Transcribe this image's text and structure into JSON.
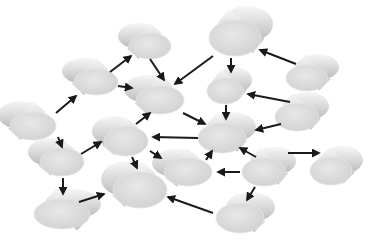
{
  "diagram": {
    "type": "network-graph",
    "background": "#ffffff",
    "node_style": {
      "shape": "3d-cylinder-disk",
      "face_color": "#d9d9d9",
      "side_light": "#f4f4f4",
      "side_dark": "#bdbdbd",
      "face_highlight": "#e6e6e6"
    },
    "edge_style": {
      "color": "#1a1a1a",
      "width": 2,
      "arrowhead": "filled-triangle"
    },
    "nodes": [
      {
        "id": "N1",
        "cx": 150,
        "cy": 46,
        "rx": 21,
        "ry": 13,
        "dx": -11,
        "dy": -10
      },
      {
        "id": "N2",
        "cx": 235,
        "cy": 38,
        "rx": 26,
        "ry": 18,
        "dx": 12,
        "dy": -14
      },
      {
        "id": "N3",
        "cx": 96,
        "cy": 82,
        "rx": 22,
        "ry": 13,
        "dx": -12,
        "dy": -11
      },
      {
        "id": "N4",
        "cx": 160,
        "cy": 100,
        "rx": 24,
        "ry": 14,
        "dx": -12,
        "dy": -11
      },
      {
        "id": "N5",
        "cx": 225,
        "cy": 91,
        "rx": 18,
        "ry": 13,
        "dx": 9,
        "dy": -11
      },
      {
        "id": "N6",
        "cx": 307,
        "cy": 78,
        "rx": 21,
        "ry": 13,
        "dx": 11,
        "dy": -11
      },
      {
        "id": "N7",
        "cx": 33,
        "cy": 126,
        "rx": 23,
        "ry": 14,
        "dx": -12,
        "dy": -11
      },
      {
        "id": "N8",
        "cx": 297,
        "cy": 117,
        "rx": 22,
        "ry": 14,
        "dx": 10,
        "dy": -11
      },
      {
        "id": "N9",
        "cx": 126,
        "cy": 141,
        "rx": 22,
        "ry": 15,
        "dx": -12,
        "dy": -10
      },
      {
        "id": "N10",
        "cx": 222,
        "cy": 138,
        "rx": 24,
        "ry": 15,
        "dx": 10,
        "dy": -11
      },
      {
        "id": "N11",
        "cx": 62,
        "cy": 162,
        "rx": 22,
        "ry": 14,
        "dx": -12,
        "dy": -10
      },
      {
        "id": "N12",
        "cx": 188,
        "cy": 172,
        "rx": 24,
        "ry": 14,
        "dx": -12,
        "dy": -9
      },
      {
        "id": "N13",
        "cx": 264,
        "cy": 172,
        "rx": 22,
        "ry": 14,
        "dx": 10,
        "dy": -11
      },
      {
        "id": "N14",
        "cx": 331,
        "cy": 171,
        "rx": 21,
        "ry": 14,
        "dx": 11,
        "dy": -11
      },
      {
        "id": "N15",
        "cx": 140,
        "cy": 190,
        "rx": 27,
        "ry": 18,
        "dx": -12,
        "dy": -11
      },
      {
        "id": "N16",
        "cx": 62,
        "cy": 214,
        "rx": 28,
        "ry": 15,
        "dx": 11,
        "dy": -10
      },
      {
        "id": "N17",
        "cx": 240,
        "cy": 218,
        "rx": 24,
        "ry": 15,
        "dx": 11,
        "dy": -11
      }
    ],
    "edges": [
      {
        "from": "N3",
        "to": "N1",
        "x1": 110,
        "y1": 72,
        "x2": 131,
        "y2": 56
      },
      {
        "from": "N1",
        "to": "N4",
        "x1": 150,
        "y1": 59,
        "x2": 164,
        "y2": 80
      },
      {
        "from": "N3",
        "to": "N4",
        "x1": 118,
        "y1": 86,
        "x2": 132,
        "y2": 88
      },
      {
        "from": "N2",
        "to": "N4",
        "x1": 213,
        "y1": 56,
        "x2": 175,
        "y2": 84
      },
      {
        "from": "N2",
        "to": "N5",
        "x1": 231,
        "y1": 58,
        "x2": 231,
        "y2": 72
      },
      {
        "from": "N6",
        "to": "N2",
        "x1": 296,
        "y1": 64,
        "x2": 260,
        "y2": 50
      },
      {
        "from": "N5",
        "to": "N10",
        "x1": 226,
        "y1": 105,
        "x2": 226,
        "y2": 119
      },
      {
        "from": "N8",
        "to": "N5",
        "x1": 290,
        "y1": 102,
        "x2": 248,
        "y2": 94
      },
      {
        "from": "N4",
        "to": "N10",
        "x1": 183,
        "y1": 113,
        "x2": 205,
        "y2": 124
      },
      {
        "from": "N10",
        "to": "N9",
        "x1": 198,
        "y1": 138,
        "x2": 153,
        "y2": 137
      },
      {
        "from": "N8",
        "to": "N10",
        "x1": 281,
        "y1": 124,
        "x2": 256,
        "y2": 130
      },
      {
        "from": "N7",
        "to": "N3",
        "x1": 56,
        "y1": 113,
        "x2": 76,
        "y2": 96
      },
      {
        "from": "N7",
        "to": "N11",
        "x1": 58,
        "y1": 137,
        "x2": 62,
        "y2": 147
      },
      {
        "from": "N11",
        "to": "N9",
        "x1": 81,
        "y1": 154,
        "x2": 101,
        "y2": 142
      },
      {
        "from": "N9",
        "to": "N4",
        "x1": 136,
        "y1": 124,
        "x2": 150,
        "y2": 113
      },
      {
        "from": "N9",
        "to": "N12",
        "x1": 150,
        "y1": 151,
        "x2": 161,
        "y2": 158
      },
      {
        "from": "N9",
        "to": "N15",
        "x1": 132,
        "y1": 157,
        "x2": 137,
        "y2": 168
      },
      {
        "from": "N11",
        "to": "N16",
        "x1": 63,
        "y1": 178,
        "x2": 63,
        "y2": 194
      },
      {
        "from": "N16",
        "to": "N15",
        "x1": 79,
        "y1": 202,
        "x2": 104,
        "y2": 194
      },
      {
        "from": "N12",
        "to": "N10",
        "x1": 206,
        "y1": 160,
        "x2": 212,
        "y2": 151
      },
      {
        "from": "N13",
        "to": "N10",
        "x1": 256,
        "y1": 157,
        "x2": 240,
        "y2": 148
      },
      {
        "from": "N13",
        "to": "N12",
        "x1": 240,
        "y1": 172,
        "x2": 218,
        "y2": 172
      },
      {
        "from": "N13",
        "to": "N14",
        "x1": 288,
        "y1": 153,
        "x2": 319,
        "y2": 153
      },
      {
        "from": "N13",
        "to": "N17",
        "x1": 255,
        "y1": 187,
        "x2": 247,
        "y2": 200
      },
      {
        "from": "N17",
        "to": "N15",
        "x1": 213,
        "y1": 213,
        "x2": 168,
        "y2": 197
      }
    ]
  }
}
